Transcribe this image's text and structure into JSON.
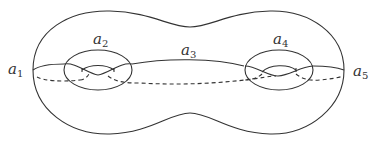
{
  "figure": {
    "stroke_color": "#333333",
    "labels": [
      {
        "id": "a1",
        "base": "a",
        "sub": "1",
        "x": 8,
        "y": 72
      },
      {
        "id": "a2",
        "base": "a",
        "sub": "2",
        "x": 93,
        "y": 32
      },
      {
        "id": "a3",
        "base": "a",
        "sub": "3",
        "x": 181,
        "y": 50
      },
      {
        "id": "a4",
        "base": "a",
        "sub": "4",
        "x": 273,
        "y": 33
      },
      {
        "id": "a5",
        "base": "a",
        "sub": "5",
        "x": 353,
        "y": 74
      }
    ]
  }
}
